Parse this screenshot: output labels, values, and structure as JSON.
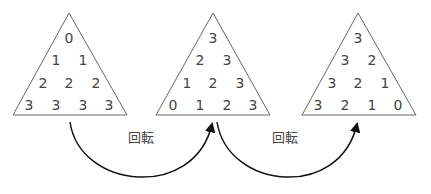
{
  "triangles": [
    {
      "rows": [
        [
          "0"
        ],
        [
          "1",
          "1"
        ],
        [
          "2",
          "2",
          "2"
        ],
        [
          "3",
          "3",
          "3",
          "3"
        ]
      ]
    },
    {
      "rows": [
        [
          "3"
        ],
        [
          "2",
          "3"
        ],
        [
          "1",
          "2",
          "3"
        ],
        [
          "0",
          "1",
          "2",
          "3"
        ]
      ]
    },
    {
      "rows": [
        [
          "3"
        ],
        [
          "3",
          "2"
        ],
        [
          "3",
          "2",
          "1"
        ],
        [
          "3",
          "2",
          "1",
          "0"
        ]
      ]
    }
  ],
  "arrows": [
    {
      "label": "回転"
    },
    {
      "label": "回転"
    }
  ]
}
